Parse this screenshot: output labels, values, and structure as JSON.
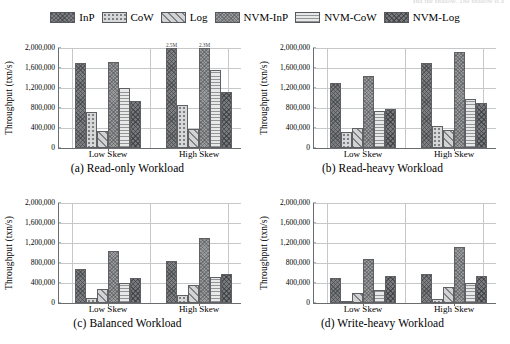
{
  "cropped_header_text": "and the shadow. The shadow is a",
  "legend": {
    "items": [
      {
        "label": "InP",
        "pattern": "p-inp"
      },
      {
        "label": "CoW",
        "pattern": "p-cow"
      },
      {
        "label": "Log",
        "pattern": "p-log"
      },
      {
        "label": "NVM-InP",
        "pattern": "p-nvminp"
      },
      {
        "label": "NVM-CoW",
        "pattern": "p-nvmcow"
      },
      {
        "label": "NVM-Log",
        "pattern": "p-nvmlog"
      }
    ]
  },
  "axis": {
    "ylabel": "Throughput (txn/s)",
    "yticks": [
      "0",
      "400,000",
      "800,000",
      "1,200,000",
      "1,600,000",
      "2,000,000"
    ],
    "ytick_values": [
      0,
      400000,
      800000,
      1200000,
      1600000,
      2000000
    ],
    "ylim": [
      0,
      2000000
    ],
    "xticks": [
      "Low Skew",
      "High Skew"
    ]
  },
  "chart_data": [
    {
      "type": "bar",
      "id": "a",
      "title": "(a) Read-only Workload",
      "categories": [
        "Low Skew",
        "High Skew"
      ],
      "xlabel": "",
      "ylabel": "Throughput (txn/s)",
      "ylim": [
        0,
        2000000
      ],
      "grid": true,
      "legend_position": "top",
      "series": [
        {
          "name": "InP",
          "values": [
            1710000,
            2500000
          ],
          "labels": [
            "",
            "2.5M"
          ]
        },
        {
          "name": "CoW",
          "values": [
            730000,
            865000
          ],
          "labels": [
            "",
            ""
          ]
        },
        {
          "name": "Log",
          "values": [
            350000,
            385000
          ],
          "labels": [
            "",
            ""
          ]
        },
        {
          "name": "NVM-InP",
          "values": [
            1715000,
            2300000
          ],
          "labels": [
            "",
            "2.3M"
          ]
        },
        {
          "name": "NVM-CoW",
          "values": [
            1205000,
            1570000
          ],
          "labels": [
            "",
            ""
          ]
        },
        {
          "name": "NVM-Log",
          "values": [
            940000,
            1115000
          ],
          "labels": [
            "",
            ""
          ]
        }
      ]
    },
    {
      "type": "bar",
      "id": "b",
      "title": "(b) Read-heavy Workload",
      "categories": [
        "Low Skew",
        "High Skew"
      ],
      "xlabel": "",
      "ylabel": "Throughput (txn/s)",
      "ylim": [
        0,
        2000000
      ],
      "grid": true,
      "legend_position": "top",
      "series": [
        {
          "name": "InP",
          "values": [
            1295000,
            1710000
          ],
          "labels": [
            "",
            ""
          ]
        },
        {
          "name": "CoW",
          "values": [
            330000,
            440000
          ],
          "labels": [
            "",
            ""
          ]
        },
        {
          "name": "Log",
          "values": [
            410000,
            365000
          ],
          "labels": [
            "",
            ""
          ]
        },
        {
          "name": "NVM-InP",
          "values": [
            1450000,
            1930000
          ],
          "labels": [
            "",
            ""
          ]
        },
        {
          "name": "NVM-CoW",
          "values": [
            745000,
            975000
          ],
          "labels": [
            "",
            ""
          ]
        },
        {
          "name": "NVM-Log",
          "values": [
            775000,
            895000
          ],
          "labels": [
            "",
            ""
          ]
        }
      ]
    },
    {
      "type": "bar",
      "id": "c",
      "title": "(c) Balanced Workload",
      "categories": [
        "Low Skew",
        "High Skew"
      ],
      "xlabel": "",
      "ylabel": "Throughput (txn/s)",
      "ylim": [
        0,
        2000000
      ],
      "grid": true,
      "legend_position": "top",
      "series": [
        {
          "name": "InP",
          "values": [
            690000,
            840000
          ],
          "labels": [
            "",
            ""
          ]
        },
        {
          "name": "CoW",
          "values": [
            105000,
            155000
          ],
          "labels": [
            "",
            ""
          ]
        },
        {
          "name": "Log",
          "values": [
            290000,
            355000
          ],
          "labels": [
            "",
            ""
          ]
        },
        {
          "name": "NVM-InP",
          "values": [
            1045000,
            1310000
          ],
          "labels": [
            "",
            ""
          ]
        },
        {
          "name": "NVM-CoW",
          "values": [
            410000,
            520000
          ],
          "labels": [
            "",
            ""
          ]
        },
        {
          "name": "NVM-Log",
          "values": [
            500000,
            585000
          ],
          "labels": [
            "",
            ""
          ]
        }
      ]
    },
    {
      "type": "bar",
      "id": "d",
      "title": "(d) Write-heavy Workload",
      "categories": [
        "Low Skew",
        "High Skew"
      ],
      "xlabel": "",
      "ylabel": "Throughput (txn/s)",
      "ylim": [
        0,
        2000000
      ],
      "grid": true,
      "legend_position": "top",
      "series": [
        {
          "name": "InP",
          "values": [
            500000,
            575000
          ],
          "labels": [
            "",
            ""
          ]
        },
        {
          "name": "CoW",
          "values": [
            45000,
            90000
          ],
          "labels": [
            "",
            ""
          ]
        },
        {
          "name": "Log",
          "values": [
            210000,
            320000
          ],
          "labels": [
            "",
            ""
          ]
        },
        {
          "name": "NVM-InP",
          "values": [
            875000,
            1125000
          ],
          "labels": [
            "",
            ""
          ]
        },
        {
          "name": "NVM-CoW",
          "values": [
            265000,
            400000
          ],
          "labels": [
            "",
            ""
          ]
        },
        {
          "name": "NVM-Log",
          "values": [
            535000,
            535000
          ],
          "labels": [
            "",
            ""
          ]
        }
      ]
    }
  ]
}
